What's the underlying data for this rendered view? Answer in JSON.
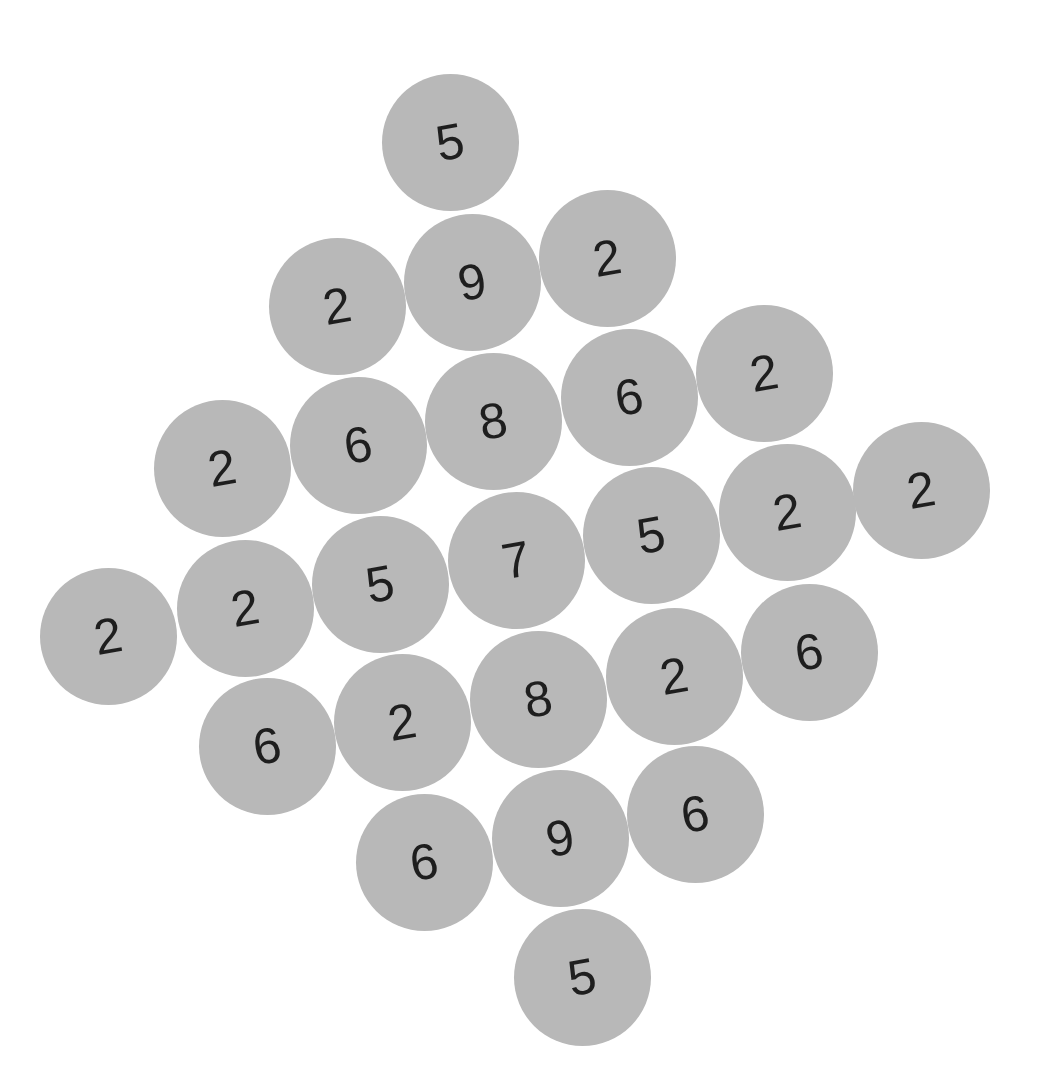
{
  "board": {
    "tile_color": "#b8b8b8",
    "digit_color": "#1e1e1e",
    "rotation_deg": -10,
    "tiles": [
      {
        "value": "5",
        "x": 450,
        "y": 142
      },
      {
        "value": "2",
        "x": 337,
        "y": 306
      },
      {
        "value": "9",
        "x": 472,
        "y": 282
      },
      {
        "value": "2",
        "x": 607,
        "y": 258
      },
      {
        "value": "2",
        "x": 222,
        "y": 468
      },
      {
        "value": "6",
        "x": 358,
        "y": 445
      },
      {
        "value": "8",
        "x": 493,
        "y": 421
      },
      {
        "value": "6",
        "x": 629,
        "y": 397
      },
      {
        "value": "2",
        "x": 764,
        "y": 373
      },
      {
        "value": "2",
        "x": 108,
        "y": 636
      },
      {
        "value": "2",
        "x": 245,
        "y": 608
      },
      {
        "value": "5",
        "x": 380,
        "y": 584
      },
      {
        "value": "7",
        "x": 516,
        "y": 560
      },
      {
        "value": "5",
        "x": 651,
        "y": 535
      },
      {
        "value": "2",
        "x": 787,
        "y": 512
      },
      {
        "value": "2",
        "x": 921,
        "y": 490
      },
      {
        "value": "6",
        "x": 267,
        "y": 746
      },
      {
        "value": "2",
        "x": 402,
        "y": 722
      },
      {
        "value": "8",
        "x": 538,
        "y": 699
      },
      {
        "value": "2",
        "x": 674,
        "y": 676
      },
      {
        "value": "6",
        "x": 809,
        "y": 652
      },
      {
        "value": "6",
        "x": 424,
        "y": 862
      },
      {
        "value": "9",
        "x": 560,
        "y": 838
      },
      {
        "value": "6",
        "x": 695,
        "y": 814
      },
      {
        "value": "5",
        "x": 582,
        "y": 977
      }
    ]
  }
}
